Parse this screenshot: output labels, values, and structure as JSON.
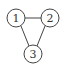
{
  "graph": {
    "nodes": [
      {
        "id": "1",
        "label": "1",
        "x": 16,
        "y": 18
      },
      {
        "id": "2",
        "label": "2",
        "x": 50,
        "y": 18
      },
      {
        "id": "3",
        "label": "3",
        "x": 33,
        "y": 54
      }
    ],
    "edges": [
      {
        "from": "1",
        "to": "2"
      },
      {
        "from": "1",
        "to": "3"
      },
      {
        "from": "2",
        "to": "3"
      }
    ],
    "node_radius": 9,
    "colors": {
      "stroke": "#444444",
      "fill": "#ffffff",
      "text": "#333333"
    }
  }
}
